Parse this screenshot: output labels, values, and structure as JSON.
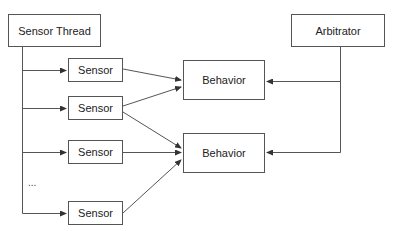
{
  "diagram": {
    "nodes": {
      "sensor_thread": {
        "label": "Sensor Thread"
      },
      "arbitrator": {
        "label": "Arbitrator"
      },
      "sensors": [
        {
          "label": "Sensor"
        },
        {
          "label": "Sensor"
        },
        {
          "label": "Sensor"
        },
        {
          "label": "Sensor"
        }
      ],
      "behaviors": [
        {
          "label": "Behavior"
        },
        {
          "label": "Behavior"
        }
      ]
    },
    "ellipsis": "...",
    "edges": [
      {
        "from": "Sensor Thread",
        "to": "Sensor 1"
      },
      {
        "from": "Sensor Thread",
        "to": "Sensor 2"
      },
      {
        "from": "Sensor Thread",
        "to": "Sensor 3"
      },
      {
        "from": "Sensor Thread",
        "to": "Sensor 4"
      },
      {
        "from": "Sensor 1",
        "to": "Behavior 1"
      },
      {
        "from": "Sensor 2",
        "to": "Behavior 1"
      },
      {
        "from": "Sensor 2",
        "to": "Behavior 2"
      },
      {
        "from": "Sensor 3",
        "to": "Behavior 2"
      },
      {
        "from": "Sensor 4",
        "to": "Behavior 2"
      },
      {
        "from": "Arbitrator",
        "to": "Behavior 1"
      },
      {
        "from": "Arbitrator",
        "to": "Behavior 2"
      }
    ],
    "colors": {
      "line": "#555555",
      "text": "#222222",
      "background": "#ffffff"
    }
  }
}
